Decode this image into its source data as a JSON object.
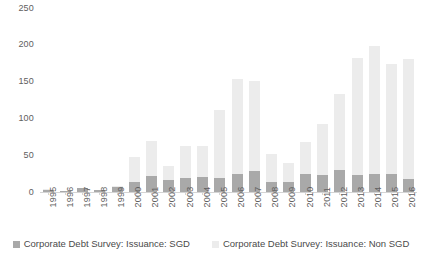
{
  "chart_data": {
    "type": "bar",
    "subtype": "stacked-column",
    "title": "",
    "xlabel": "",
    "ylabel": "",
    "ylim": [
      0,
      250
    ],
    "ytick_step": 50,
    "ytick_labels": [
      "250",
      "200",
      "150",
      "100",
      "50",
      "0"
    ],
    "ytick_values": [
      250,
      200,
      150,
      100,
      50,
      0
    ],
    "grid": false,
    "legend_position": "bottom",
    "categories": [
      "1995",
      "1996",
      "1997",
      "1998",
      "1999",
      "2000",
      "2001",
      "2002",
      "2003",
      "2004",
      "2005",
      "2006",
      "2007",
      "2008",
      "2009",
      "2010",
      "2011",
      "2012",
      "2013",
      "2014",
      "2015",
      "2016"
    ],
    "series": [
      {
        "name": "Corporate Debt Survey: Issuance: SGD",
        "color": "#a9a9a9",
        "values": [
          3,
          2,
          5,
          3,
          7,
          13,
          22,
          17,
          19,
          21,
          19,
          25,
          29,
          13,
          14,
          24,
          23,
          30,
          23,
          24,
          24,
          18
        ]
      },
      {
        "name": "Corporate Debt Survey: Issuance: Non SGD",
        "color": "#ececec",
        "values": [
          1,
          0,
          0,
          0,
          1,
          35,
          48,
          18,
          44,
          42,
          92,
          128,
          122,
          38,
          26,
          44,
          70,
          103,
          159,
          174,
          150,
          163
        ]
      }
    ],
    "totals": [
      4,
      2,
      5,
      3,
      8,
      48,
      70,
      35,
      63,
      63,
      111,
      153,
      151,
      51,
      40,
      68,
      93,
      133,
      182,
      198,
      174,
      181
    ]
  },
  "legend": {
    "items": [
      {
        "label": "Corporate Debt Survey: Issuance: SGD",
        "color": "#a9a9a9"
      },
      {
        "label": "Corporate Debt Survey: Issuance: Non SGD",
        "color": "#ececec"
      }
    ]
  },
  "caption_sliver": ""
}
